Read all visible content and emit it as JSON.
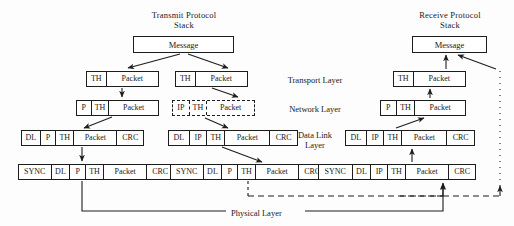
{
  "diagram": {
    "title_transmit": "Transmit Protocol\nStack",
    "title_receive": "Receive Protocol\nStack",
    "message_label": "Message",
    "layer_labels": {
      "transport": "Transport Layer",
      "network": "Network Layer",
      "datalink": "Data Link\nLayer",
      "physical": "Physical Layer"
    },
    "stacks": [
      {
        "name": "transmit-stack",
        "message": "Message",
        "rows": [
          {
            "layer": "transport",
            "fields": [
              "TH",
              "Packet"
            ],
            "style": "solid"
          },
          {
            "layer": "network",
            "fields": [
              "P",
              "TH",
              "Packet"
            ],
            "style": "solid"
          },
          {
            "layer": "datalink",
            "fields": [
              "DL",
              "P",
              "TH",
              "Packet",
              "CRC"
            ],
            "style": "solid"
          },
          {
            "layer": "physical",
            "fields": [
              "SYNC",
              "DL",
              "P",
              "TH",
              "Packet",
              "CRC"
            ],
            "style": "solid"
          }
        ]
      },
      {
        "name": "intermediate-stack",
        "rows": [
          {
            "layer": "transport",
            "fields": [
              "TH",
              "Packet"
            ],
            "style": "solid"
          },
          {
            "layer": "network",
            "fields": [
              "IP",
              "TH",
              "Packet"
            ],
            "style": "dashed"
          },
          {
            "layer": "datalink",
            "fields": [
              "DL",
              "IP",
              "TH",
              "Packet",
              "CRC"
            ],
            "style": "solid"
          },
          {
            "layer": "physical",
            "fields": [
              "SYNC",
              "DL",
              "P",
              "TH",
              "Packet",
              "CRC"
            ],
            "style": "solid"
          }
        ]
      },
      {
        "name": "receive-stack",
        "message": "Message",
        "rows": [
          {
            "layer": "transport",
            "fields": [
              "TH",
              "Packet"
            ],
            "style": "solid"
          },
          {
            "layer": "network",
            "fields": [
              "P",
              "TH",
              "Packet"
            ],
            "style": "solid"
          },
          {
            "layer": "datalink",
            "fields": [
              "DL",
              "IP",
              "TH",
              "Packet",
              "CRC"
            ],
            "style": "solid"
          },
          {
            "layer": "physical",
            "fields": [
              "SYNC",
              "DL",
              "IP",
              "TH",
              "Packet",
              "CRC"
            ],
            "style": "solid"
          }
        ]
      }
    ],
    "colors": {
      "line": "#1d1d1d",
      "background": "#fdfdfd",
      "text": "#1a1a1a"
    }
  }
}
